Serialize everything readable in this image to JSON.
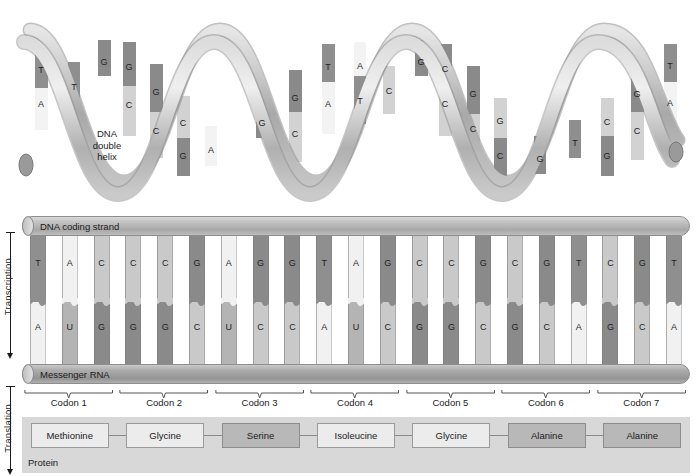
{
  "figure": {
    "helix_caption": "DNA\ndouble\nhelix",
    "helix_caption_lines": [
      "DNA",
      "double",
      "helix"
    ]
  },
  "side_labels": {
    "transcription": "Transcription",
    "translation": "Translation"
  },
  "strands": {
    "dna_label": "DNA coding strand",
    "rna_label": "Messenger RNA",
    "dna_sequence": [
      "T",
      "A",
      "C",
      "C",
      "C",
      "G",
      "A",
      "G",
      "G",
      "T",
      "A",
      "G",
      "C",
      "C",
      "G",
      "C",
      "G",
      "T",
      "C",
      "G",
      "T"
    ],
    "rna_sequence": [
      "A",
      "U",
      "G",
      "G",
      "G",
      "C",
      "U",
      "C",
      "C",
      "A",
      "U",
      "C",
      "G",
      "G",
      "C",
      "G",
      "C",
      "A",
      "G",
      "C",
      "A"
    ]
  },
  "codons": {
    "labels": [
      "Codon 1",
      "Codon 2",
      "Codon 3",
      "Codon 4",
      "Codon 5",
      "Codon 6",
      "Codon 7"
    ],
    "triplets": [
      "AUG",
      "GGC",
      "UCC",
      "AUC",
      "GGC",
      "GCA",
      "GCA"
    ]
  },
  "protein": {
    "caption": "Protein",
    "residues": [
      {
        "name": "Methionine",
        "shaded": false
      },
      {
        "name": "Glycine",
        "shaded": false
      },
      {
        "name": "Serine",
        "shaded": true
      },
      {
        "name": "Isoleucine",
        "shaded": false
      },
      {
        "name": "Glycine",
        "shaded": false
      },
      {
        "name": "Alanine",
        "shaded": true
      },
      {
        "name": "Alanine",
        "shaded": true
      }
    ]
  },
  "helix_bases": [
    {
      "letter": "T",
      "x": 41,
      "y": 66
    },
    {
      "letter": "A",
      "x": 41,
      "y": 100
    },
    {
      "letter": "T",
      "x": 74,
      "y": 83
    },
    {
      "letter": "G",
      "x": 104,
      "y": 58
    },
    {
      "letter": "G",
      "x": 129,
      "y": 63
    },
    {
      "letter": "C",
      "x": 129,
      "y": 101
    },
    {
      "letter": "G",
      "x": 156,
      "y": 88
    },
    {
      "letter": "C",
      "x": 156,
      "y": 127
    },
    {
      "letter": "C",
      "x": 183,
      "y": 119
    },
    {
      "letter": "G",
      "x": 183,
      "y": 152
    },
    {
      "letter": "A",
      "x": 211,
      "y": 146
    },
    {
      "letter": "G",
      "x": 262,
      "y": 119
    },
    {
      "letter": "G",
      "x": 295,
      "y": 94
    },
    {
      "letter": "C",
      "x": 295,
      "y": 130
    },
    {
      "letter": "T",
      "x": 328,
      "y": 63
    },
    {
      "letter": "A",
      "x": 328,
      "y": 100
    },
    {
      "letter": "A",
      "x": 360,
      "y": 62
    },
    {
      "letter": "T",
      "x": 360,
      "y": 97
    },
    {
      "letter": "C",
      "x": 389,
      "y": 87
    },
    {
      "letter": "G",
      "x": 421,
      "y": 58
    },
    {
      "letter": "C",
      "x": 445,
      "y": 65
    },
    {
      "letter": "C",
      "x": 445,
      "y": 100
    },
    {
      "letter": "G",
      "x": 473,
      "y": 90
    },
    {
      "letter": "C",
      "x": 473,
      "y": 125
    },
    {
      "letter": "G",
      "x": 500,
      "y": 117
    },
    {
      "letter": "C",
      "x": 500,
      "y": 152
    },
    {
      "letter": "G",
      "x": 540,
      "y": 155
    },
    {
      "letter": "T",
      "x": 575,
      "y": 139
    },
    {
      "letter": "C",
      "x": 607,
      "y": 118
    },
    {
      "letter": "G",
      "x": 607,
      "y": 152
    },
    {
      "letter": "G",
      "x": 637,
      "y": 90
    },
    {
      "letter": "C",
      "x": 637,
      "y": 127
    },
    {
      "letter": "T",
      "x": 670,
      "y": 62
    },
    {
      "letter": "A",
      "x": 670,
      "y": 99
    }
  ],
  "colors": {
    "nt_T": "#8f8f8f",
    "nt_A": "#f1f1f1",
    "nt_C": "#c9c9c9",
    "nt_G": "#8a8a8a",
    "nt_U": "#b4b4b4",
    "backbone": "#b5b5b5",
    "protein_band": "#d8d8d8",
    "residue_shaded": "#b8b8b8",
    "residue_plain": "#ececec"
  }
}
